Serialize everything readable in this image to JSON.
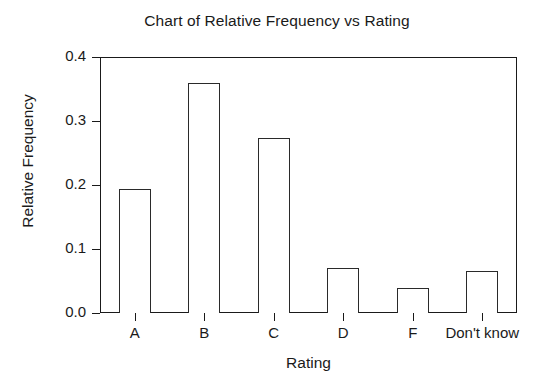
{
  "chart_data": {
    "type": "bar",
    "title": "Chart of Relative Frequency vs Rating",
    "xlabel": "Rating",
    "ylabel": "Relative Frequency",
    "categories": [
      "A",
      "B",
      "C",
      "D",
      "F",
      "Don't know"
    ],
    "values": [
      0.193,
      0.359,
      0.273,
      0.07,
      0.039,
      0.066
    ],
    "ylim": [
      0.0,
      0.4
    ],
    "yticks": [
      0.0,
      0.1,
      0.2,
      0.3,
      0.4
    ],
    "ytick_labels": [
      "0.0",
      "0.1",
      "0.2",
      "0.3",
      "0.4"
    ],
    "grid": false,
    "legend": null,
    "bar_style": {
      "fill": "#ffffff",
      "edge_color": "#1a1a1a",
      "edge_width": 1.4
    },
    "frame": {
      "box": true,
      "color": "#1a1a1a"
    },
    "background": "#ffffff"
  }
}
